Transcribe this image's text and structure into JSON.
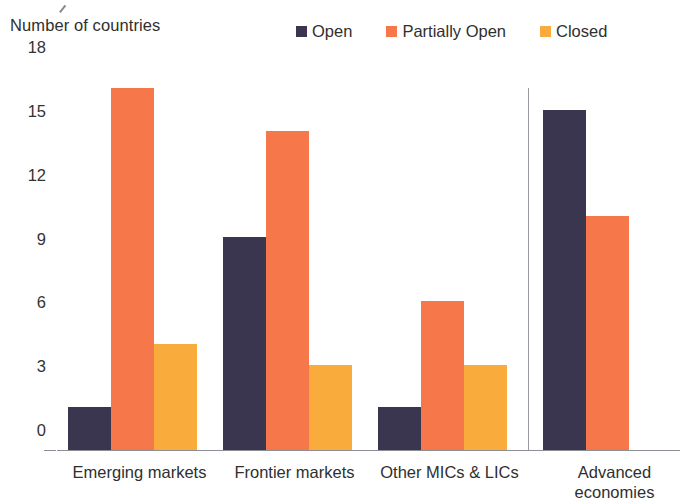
{
  "chart_data": {
    "type": "bar",
    "title": "Number of countries",
    "xlabel": "",
    "ylabel": "Number of countries",
    "ylim": [
      0,
      18
    ],
    "yticks": [
      18,
      15,
      12,
      9,
      6,
      3,
      0
    ],
    "grid": false,
    "legend_position": "top-right",
    "categories": [
      "Emerging markets",
      "Frontier markets",
      "Other MICs & LICs",
      "Advanced\neconomies"
    ],
    "series": [
      {
        "name": "Open",
        "color": "#3b3650",
        "values": [
          2,
          10,
          2,
          16
        ]
      },
      {
        "name": "Partially Open",
        "color": "#f5774a",
        "values": [
          17,
          15,
          7,
          11
        ]
      },
      {
        "name": "Closed",
        "color": "#f9ab3c",
        "values": [
          5,
          4,
          4,
          null
        ]
      }
    ],
    "annotations": [
      {
        "name": "group-separator",
        "description": "vertical rule before Advanced economies"
      }
    ]
  }
}
